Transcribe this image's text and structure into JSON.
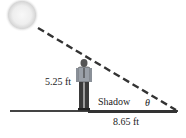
{
  "diagram": {
    "height_label": "5.25 ft",
    "shadow_label": "Shadow",
    "length_label": "8.65 ft",
    "angle_label": "θ",
    "colors": {
      "line": "#333333",
      "sun_core": "#f4f4f4",
      "sun_glow": "#c8c8c8",
      "shirt": "#9aa0a8",
      "pants": "#3a3a3a"
    }
  }
}
